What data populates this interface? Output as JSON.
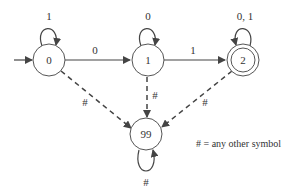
{
  "diagram": {
    "type": "finite-state-automaton",
    "start_state": "0",
    "accept_states": [
      "2"
    ],
    "states": [
      {
        "id": "0",
        "label": "0"
      },
      {
        "id": "1",
        "label": "1"
      },
      {
        "id": "2",
        "label": "2"
      },
      {
        "id": "99",
        "label": "99"
      }
    ],
    "transitions": [
      {
        "from": "0",
        "to": "0",
        "label": "1"
      },
      {
        "from": "0",
        "to": "1",
        "label": "0"
      },
      {
        "from": "1",
        "to": "1",
        "label": "0"
      },
      {
        "from": "1",
        "to": "2",
        "label": "1"
      },
      {
        "from": "2",
        "to": "2",
        "label": "0, 1"
      },
      {
        "from": "0",
        "to": "99",
        "label": "#"
      },
      {
        "from": "1",
        "to": "99",
        "label": "#"
      },
      {
        "from": "2",
        "to": "99",
        "label": "#"
      },
      {
        "from": "99",
        "to": "99",
        "label": "#"
      }
    ],
    "legend": "# = any other symbol"
  }
}
